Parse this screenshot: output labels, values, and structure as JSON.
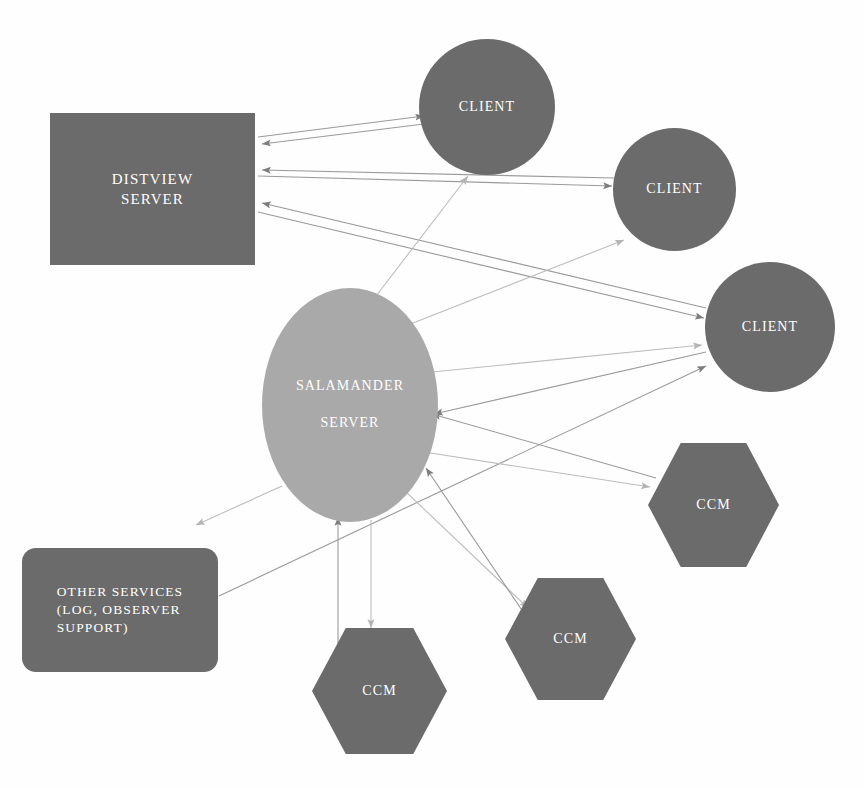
{
  "diagram": {
    "background_color": "#ffffff",
    "node_fill_dark": "#6b6b6b",
    "node_fill_light": "#a9a9a9",
    "node_text_color": "#ffffff",
    "edge_color": "#8c8c8c"
  },
  "nodes": {
    "distview_server": {
      "label_line1": "DISTVIEW",
      "label_line2": "SERVER",
      "shape": "rectangle",
      "fill": "#6b6b6b"
    },
    "salamander_server": {
      "label_line1": "SALAMANDER",
      "label_line2": "SERVER",
      "shape": "ellipse",
      "fill": "#a9a9a9"
    },
    "other_services": {
      "label_line1": "OTHER SERVICES",
      "label_line2": "(LOG, OBSERVER",
      "label_line3": "SUPPORT)",
      "shape": "rounded-rectangle",
      "fill": "#6b6b6b"
    },
    "clients": [
      {
        "label": "CLIENT",
        "shape": "circle",
        "fill": "#6b6b6b"
      },
      {
        "label": "CLIENT",
        "shape": "circle",
        "fill": "#6b6b6b"
      },
      {
        "label": "CLIENT",
        "shape": "circle",
        "fill": "#6b6b6b"
      }
    ],
    "ccms": [
      {
        "label": "CCM",
        "shape": "hexagon",
        "fill": "#6b6b6b"
      },
      {
        "label": "CCM",
        "shape": "hexagon",
        "fill": "#6b6b6b"
      },
      {
        "label": "CCM",
        "shape": "hexagon",
        "fill": "#6b6b6b"
      }
    ]
  },
  "edges": [
    {
      "from": "distview_server",
      "to": "client_1",
      "direction": "out"
    },
    {
      "from": "client_1",
      "to": "distview_server",
      "direction": "in"
    },
    {
      "from": "distview_server",
      "to": "client_2",
      "direction": "out"
    },
    {
      "from": "client_2",
      "to": "distview_server",
      "direction": "in"
    },
    {
      "from": "distview_server",
      "to": "client_3",
      "direction": "out"
    },
    {
      "from": "client_3",
      "to": "distview_server",
      "direction": "in"
    },
    {
      "from": "salamander_server",
      "to": "client_1",
      "direction": "out"
    },
    {
      "from": "salamander_server",
      "to": "client_2",
      "direction": "out"
    },
    {
      "from": "salamander_server",
      "to": "client_3",
      "direction": "out"
    },
    {
      "from": "client_3",
      "to": "salamander_server",
      "direction": "in"
    },
    {
      "from": "salamander_server",
      "to": "other_services",
      "direction": "out"
    },
    {
      "from": "other_services",
      "to": "client_3",
      "direction": "out"
    },
    {
      "from": "salamander_server",
      "to": "ccm_1",
      "direction": "out"
    },
    {
      "from": "ccm_1",
      "to": "salamander_server",
      "direction": "in"
    },
    {
      "from": "salamander_server",
      "to": "ccm_2",
      "direction": "out"
    },
    {
      "from": "ccm_2",
      "to": "salamander_server",
      "direction": "in"
    },
    {
      "from": "salamander_server",
      "to": "ccm_3",
      "direction": "out"
    },
    {
      "from": "ccm_3",
      "to": "salamander_server",
      "direction": "in"
    }
  ]
}
